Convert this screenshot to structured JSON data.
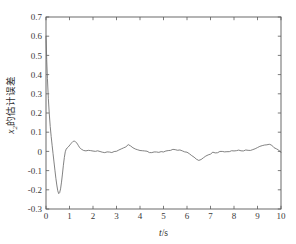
{
  "figure": {
    "background_color": "#ffffff",
    "line_color": "#6b6b6b",
    "axis_color": "#5a5a5a"
  },
  "labels": {
    "ylabel_var": "x",
    "ylabel_sub": "2",
    "ylabel_rest": "的估计误差",
    "xlabel_var": "t",
    "xlabel_rest": "/s"
  },
  "chart_data": {
    "type": "line",
    "title": "",
    "xlabel": "t/s",
    "ylabel": "x2的估计误差",
    "xlim": [
      0,
      10
    ],
    "ylim": [
      -0.3,
      0.7
    ],
    "grid": false,
    "legend": "none",
    "xticks": [
      0,
      1,
      2,
      3,
      4,
      5,
      6,
      7,
      8,
      9,
      10
    ],
    "xtick_labels": [
      "0",
      "1",
      "2",
      "3",
      "4",
      "5",
      "6",
      "7",
      "8",
      "9",
      "10"
    ],
    "yticks": [
      -0.3,
      -0.2,
      -0.1,
      0,
      0.1,
      0.2,
      0.3,
      0.4,
      0.5,
      0.6,
      0.7
    ],
    "ytick_labels": [
      "-0.3",
      "-0.2",
      "-0.1",
      "0",
      "0.1",
      "0.2",
      "0.3",
      "0.4",
      "0.5",
      "0.6",
      "0.7"
    ],
    "series": [
      {
        "name": "x2 estimation error",
        "color": "#6b6b6b",
        "x": [
          0.0,
          0.03,
          0.06,
          0.1,
          0.14,
          0.18,
          0.22,
          0.26,
          0.3,
          0.34,
          0.38,
          0.42,
          0.46,
          0.5,
          0.54,
          0.58,
          0.62,
          0.66,
          0.7,
          0.74,
          0.78,
          0.82,
          0.86,
          0.9,
          0.94,
          0.98,
          1.02,
          1.06,
          1.1,
          1.14,
          1.18,
          1.22,
          1.26,
          1.3,
          1.34,
          1.38,
          1.42,
          1.46,
          1.5,
          1.6,
          1.7,
          1.8,
          1.9,
          2.0,
          2.1,
          2.2,
          2.3,
          2.4,
          2.5,
          2.6,
          2.7,
          2.8,
          2.9,
          3.0,
          3.1,
          3.2,
          3.3,
          3.4,
          3.5,
          3.6,
          3.7,
          3.8,
          3.9,
          4.0,
          4.1,
          4.2,
          4.3,
          4.4,
          4.5,
          4.6,
          4.7,
          4.8,
          4.9,
          5.0,
          5.1,
          5.2,
          5.3,
          5.4,
          5.5,
          5.6,
          5.7,
          5.8,
          5.9,
          6.0,
          6.1,
          6.2,
          6.3,
          6.4,
          6.5,
          6.6,
          6.7,
          6.8,
          6.9,
          7.0,
          7.1,
          7.2,
          7.3,
          7.4,
          7.5,
          7.6,
          7.7,
          7.8,
          7.9,
          8.0,
          8.1,
          8.2,
          8.3,
          8.4,
          8.5,
          8.6,
          8.7,
          8.8,
          8.9,
          9.0,
          9.1,
          9.2,
          9.3,
          9.4,
          9.5,
          9.6,
          9.7,
          9.8,
          9.9,
          10.0
        ],
        "y": [
          0.6,
          0.48,
          0.38,
          0.275,
          0.195,
          0.13,
          0.078,
          0.032,
          -0.012,
          -0.055,
          -0.098,
          -0.14,
          -0.175,
          -0.205,
          -0.22,
          -0.215,
          -0.195,
          -0.16,
          -0.118,
          -0.072,
          -0.032,
          -0.002,
          0.012,
          0.018,
          0.022,
          0.028,
          0.034,
          0.04,
          0.046,
          0.051,
          0.053,
          0.053,
          0.05,
          0.045,
          0.038,
          0.03,
          0.022,
          0.016,
          0.012,
          0.008,
          0.006,
          0.005,
          0.004,
          0.003,
          0.002,
          0.001,
          0.0,
          -0.002,
          -0.004,
          -0.005,
          -0.005,
          -0.004,
          -0.002,
          0.001,
          0.005,
          0.01,
          0.017,
          0.026,
          0.034,
          0.03,
          0.022,
          0.014,
          0.008,
          0.004,
          0.002,
          0.0,
          -0.002,
          -0.003,
          -0.004,
          -0.005,
          -0.005,
          -0.004,
          -0.003,
          -0.001,
          0.001,
          0.004,
          0.007,
          0.009,
          0.01,
          0.009,
          0.007,
          0.004,
          0.0,
          -0.005,
          -0.012,
          -0.02,
          -0.03,
          -0.04,
          -0.047,
          -0.044,
          -0.036,
          -0.027,
          -0.018,
          -0.011,
          -0.007,
          -0.005,
          -0.004,
          -0.003,
          -0.002,
          -0.001,
          0.0,
          0.001,
          0.002,
          0.003,
          0.003,
          0.004,
          0.004,
          0.005,
          0.005,
          0.006,
          0.008,
          0.011,
          0.015,
          0.019,
          0.023,
          0.028,
          0.032,
          0.035,
          0.035,
          0.03,
          0.022,
          0.013,
          0.004,
          -0.003
        ]
      }
    ],
    "annotations": [
      {
        "label": "initial value",
        "x": 0.0,
        "y": 0.6
      },
      {
        "label": "undershoot minimum",
        "x": 0.54,
        "y": -0.22
      },
      {
        "label": "first overshoot peak",
        "x": 1.2,
        "y": 0.053
      },
      {
        "label": "bump",
        "x": 3.5,
        "y": 0.034
      },
      {
        "label": "dip",
        "x": 6.5,
        "y": -0.047
      },
      {
        "label": "late bump",
        "x": 9.5,
        "y": 0.035
      }
    ]
  }
}
